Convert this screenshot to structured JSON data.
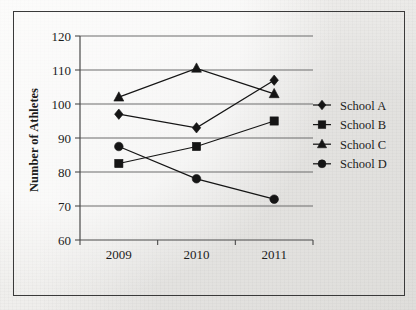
{
  "chart_data": {
    "type": "line",
    "title": "",
    "subtitle": "",
    "xlabel": "",
    "ylabel": "Number of Athletes",
    "categories": [
      "2009",
      "2010",
      "2011"
    ],
    "x_tick_labels": [
      "2009",
      "2010",
      "2011"
    ],
    "y_tick_labels": [
      "60",
      "70",
      "80",
      "90",
      "100",
      "110",
      "120"
    ],
    "ylim": [
      60,
      120
    ],
    "y_tick_step": 10,
    "grid": "horizontal",
    "legend_position": "right",
    "series": [
      {
        "name": "School A",
        "marker": "diamond",
        "values": [
          97,
          93,
          107
        ]
      },
      {
        "name": "School B",
        "marker": "square",
        "values": [
          82.5,
          87.5,
          95
        ]
      },
      {
        "name": "School C",
        "marker": "triangle",
        "values": [
          102,
          110.5,
          103
        ]
      },
      {
        "name": "School D",
        "marker": "circle",
        "values": [
          87.5,
          78,
          72
        ]
      }
    ],
    "colors": {
      "line": "#151515",
      "marker": "#151515",
      "gridline": "#6d6d6d",
      "axis": "#4a4a4a",
      "text": "#1c1c1c",
      "background": "#f2f1ef",
      "border": "#3a3a3a"
    }
  },
  "legend": {
    "entries": [
      {
        "label": "School A",
        "marker": "diamond"
      },
      {
        "label": "School B",
        "marker": "square"
      },
      {
        "label": "School C",
        "marker": "triangle"
      },
      {
        "label": "School D",
        "marker": "circle"
      }
    ]
  }
}
